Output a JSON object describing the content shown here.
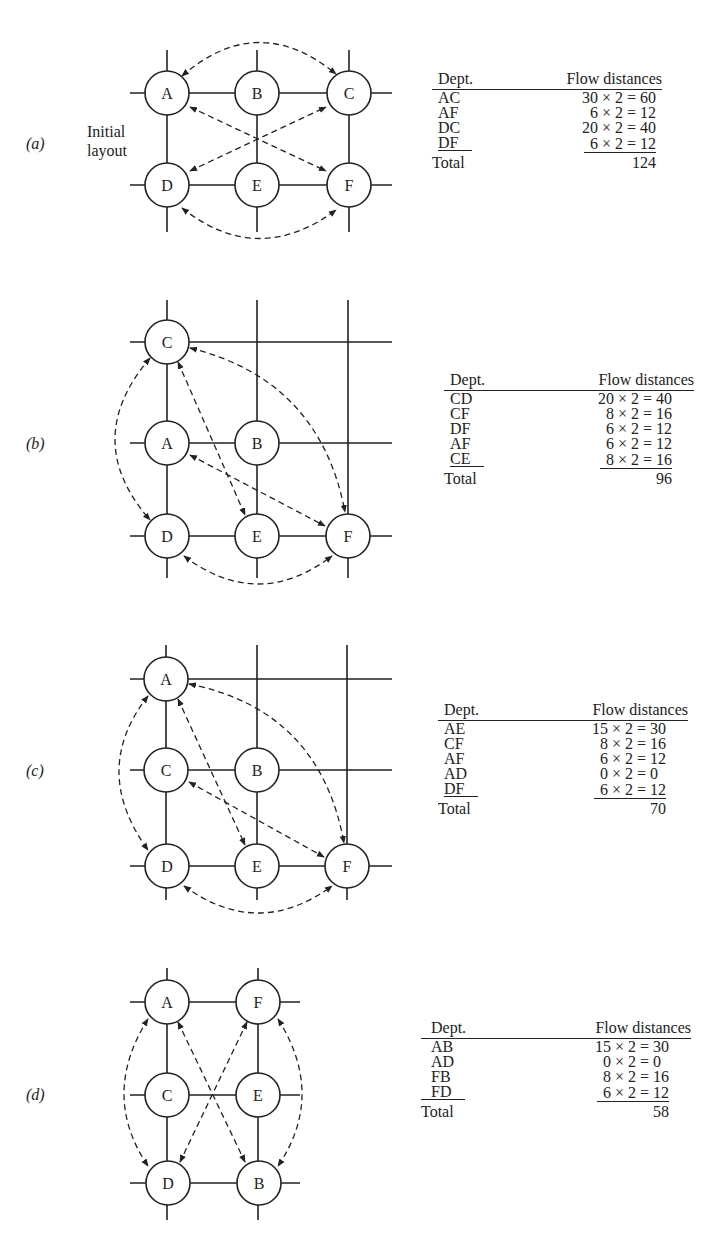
{
  "figure": {
    "panels": [
      {
        "id": "a",
        "label": "(a)",
        "note_line1": "Initial",
        "note_line2": "layout",
        "nodes": [
          {
            "name": "A",
            "x": 167,
            "y": 93
          },
          {
            "name": "B",
            "x": 257,
            "y": 93
          },
          {
            "name": "C",
            "x": 349,
            "y": 93
          },
          {
            "name": "D",
            "x": 167,
            "y": 185
          },
          {
            "name": "E",
            "x": 257,
            "y": 185
          },
          {
            "name": "F",
            "x": 349,
            "y": 185
          }
        ],
        "table": {
          "header_dept": "Dept.",
          "header_flow": "Flow distances",
          "rows": [
            {
              "dept": "AC",
              "flow": "30 × 2 = 60"
            },
            {
              "dept": "AF",
              "flow": "6 × 2 = 12"
            },
            {
              "dept": "DC",
              "flow": "20 × 2 = 40"
            },
            {
              "dept": "DF",
              "flow": "6 × 2 = 12"
            }
          ],
          "total_label": "Total",
          "total_value": "124"
        }
      },
      {
        "id": "b",
        "label": "(b)",
        "nodes": [
          {
            "name": "C",
            "x": 167,
            "y": 342
          },
          {
            "name": "A",
            "x": 167,
            "y": 443
          },
          {
            "name": "B",
            "x": 257,
            "y": 443
          },
          {
            "name": "D",
            "x": 167,
            "y": 536
          },
          {
            "name": "E",
            "x": 257,
            "y": 536
          },
          {
            "name": "F",
            "x": 348,
            "y": 536
          }
        ],
        "table": {
          "header_dept": "Dept.",
          "header_flow": "Flow distances",
          "rows": [
            {
              "dept": "CD",
              "flow": "20 × 2 = 40"
            },
            {
              "dept": "CF",
              "flow": "8 × 2 = 16"
            },
            {
              "dept": "DF",
              "flow": "6 × 2 = 12"
            },
            {
              "dept": "AF",
              "flow": "6 × 2 = 12"
            },
            {
              "dept": "CE",
              "flow": "8 × 2 = 16"
            }
          ],
          "total_label": "Total",
          "total_value": "96"
        }
      },
      {
        "id": "c",
        "label": "(c)",
        "nodes": [
          {
            "name": "A",
            "x": 166,
            "y": 679
          },
          {
            "name": "C",
            "x": 166,
            "y": 770
          },
          {
            "name": "B",
            "x": 257,
            "y": 770
          },
          {
            "name": "D",
            "x": 167,
            "y": 866
          },
          {
            "name": "E",
            "x": 257,
            "y": 866
          },
          {
            "name": "F",
            "x": 347,
            "y": 866
          }
        ],
        "table": {
          "header_dept": "Dept.",
          "header_flow": "Flow distances",
          "rows": [
            {
              "dept": "AE",
              "flow": "15 × 2 = 30"
            },
            {
              "dept": "CF",
              "flow": "8 × 2 = 16"
            },
            {
              "dept": "AF",
              "flow": "6 × 2 = 12"
            },
            {
              "dept": "AD",
              "flow": "0 × 2 = 0"
            },
            {
              "dept": "DF",
              "flow": "6 × 2 = 12"
            }
          ],
          "total_label": "Total",
          "total_value": "70"
        }
      },
      {
        "id": "d",
        "label": "(d)",
        "nodes": [
          {
            "name": "A",
            "x": 167,
            "y": 1002
          },
          {
            "name": "F",
            "x": 258,
            "y": 1002
          },
          {
            "name": "C",
            "x": 167,
            "y": 1095
          },
          {
            "name": "E",
            "x": 258,
            "y": 1095
          },
          {
            "name": "D",
            "x": 168,
            "y": 1183
          },
          {
            "name": "B",
            "x": 259,
            "y": 1183
          }
        ],
        "table": {
          "header_dept": "Dept.",
          "header_flow": "Flow distances",
          "rows": [
            {
              "dept": "AB",
              "flow": "15 × 2 = 30"
            },
            {
              "dept": "AD",
              "flow": "0 × 2 = 0"
            },
            {
              "dept": "FB",
              "flow": "8 × 2 = 16"
            },
            {
              "dept": "FD",
              "flow": "6 × 2 = 12"
            }
          ],
          "total_label": "Total",
          "total_value": "58"
        }
      }
    ]
  }
}
